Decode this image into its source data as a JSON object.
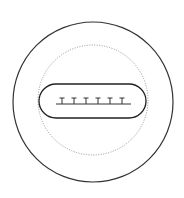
{
  "diagram": {
    "pin_count": 6,
    "colors": {
      "outer_ring": "#333333",
      "dotted_ring": "#888888",
      "slot": "#222222",
      "pins": "#333333",
      "background": "#ffffff"
    },
    "parts": [
      {
        "id": "outer-ring",
        "style": "solid"
      },
      {
        "id": "inner-dotted-ring",
        "style": "dotted"
      },
      {
        "id": "connector-slot",
        "style": "solid"
      },
      {
        "id": "contact-pins",
        "style": "solid"
      }
    ]
  }
}
